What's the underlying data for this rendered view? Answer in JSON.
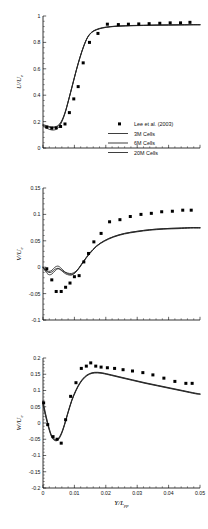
{
  "figure": {
    "panel_count": 3,
    "background": "#ffffff",
    "marker_color": "#000000",
    "line_colors": {
      "3M": "#1c1c1c",
      "6M": "#3a3a3a",
      "20M": "#8c8c8c"
    }
  },
  "legend": {
    "position": "inside-lower-right-of-top-panel",
    "entries": [
      {
        "label": "Lee et al. (2003)",
        "style": "marker",
        "marker": "filled-square"
      },
      {
        "label": "3M Cells",
        "style": "line"
      },
      {
        "label": "6M Cells",
        "style": "line"
      },
      {
        "label": "20M Cells",
        "style": "line"
      }
    ]
  },
  "chart_data": [
    {
      "type": "line",
      "id": "u-velocity",
      "title": "",
      "xlabel": "",
      "ylabel": "U/U_e",
      "ylabel_main": "U/U",
      "ylabel_sub": "e",
      "xlim": [
        0,
        0.05
      ],
      "ylim": [
        0,
        1
      ],
      "xticks": [
        0,
        0.01,
        0.02,
        0.03,
        0.04,
        0.05
      ],
      "xticklabels": [
        "",
        "",
        "",
        "",
        "",
        ""
      ],
      "yticks": [
        0,
        0.2,
        0.4,
        0.6,
        0.8,
        1
      ],
      "yticklabels": [
        "0",
        "0.2",
        "0.4",
        "0.6",
        "0.8",
        "1"
      ],
      "grid": false,
      "x": [
        0.0005,
        0.0022,
        0.0037,
        0.0052,
        0.0068,
        0.0083,
        0.0098,
        0.0113,
        0.0128,
        0.0143,
        0.0162,
        0.0185,
        0.0215,
        0.0248,
        0.0282,
        0.0315,
        0.035,
        0.0385,
        0.042,
        0.0455,
        0.048
      ],
      "markers": {
        "name": "Lee et al. (2003)",
        "x": [
          0.0012,
          0.0028,
          0.0042,
          0.0056,
          0.007,
          0.0084,
          0.0098,
          0.0112,
          0.0128,
          0.0148,
          0.0175,
          0.0205,
          0.024,
          0.0272,
          0.0305,
          0.0338,
          0.0372,
          0.0405,
          0.0438,
          0.0468
        ],
        "y": [
          0.158,
          0.15,
          0.152,
          0.163,
          0.182,
          0.268,
          0.372,
          0.465,
          0.645,
          0.8,
          0.868,
          0.938,
          0.935,
          0.938,
          0.94,
          0.942,
          0.945,
          0.948,
          0.948,
          0.952
        ]
      },
      "series": [
        {
          "name": "3M Cells",
          "x": [
            0.0,
            0.001,
            0.0022,
            0.0034,
            0.0046,
            0.0058,
            0.007,
            0.0082,
            0.0094,
            0.0106,
            0.0118,
            0.013,
            0.0142,
            0.0155,
            0.017,
            0.019,
            0.0215,
            0.0245,
            0.028,
            0.032,
            0.036,
            0.04,
            0.044,
            0.048,
            0.05
          ],
          "y": [
            0.178,
            0.17,
            0.162,
            0.16,
            0.168,
            0.2,
            0.268,
            0.37,
            0.48,
            0.59,
            0.69,
            0.775,
            0.84,
            0.878,
            0.898,
            0.912,
            0.92,
            0.925,
            0.928,
            0.93,
            0.932,
            0.933,
            0.934,
            0.935,
            0.935
          ]
        },
        {
          "name": "6M Cells",
          "x": [
            0.0,
            0.001,
            0.0022,
            0.0034,
            0.0046,
            0.0058,
            0.007,
            0.0082,
            0.0094,
            0.0106,
            0.0118,
            0.013,
            0.0142,
            0.0155,
            0.017,
            0.019,
            0.0215,
            0.0245,
            0.028,
            0.032,
            0.036,
            0.04,
            0.044,
            0.048,
            0.05
          ],
          "y": [
            0.172,
            0.164,
            0.156,
            0.154,
            0.163,
            0.196,
            0.265,
            0.368,
            0.478,
            0.588,
            0.688,
            0.773,
            0.838,
            0.876,
            0.896,
            0.91,
            0.919,
            0.924,
            0.927,
            0.929,
            0.931,
            0.932,
            0.933,
            0.934,
            0.934
          ]
        },
        {
          "name": "20M Cells",
          "x": [
            0.0,
            0.001,
            0.0022,
            0.0034,
            0.0046,
            0.0058,
            0.007,
            0.0082,
            0.0094,
            0.0106,
            0.0118,
            0.013,
            0.0142,
            0.0155,
            0.017,
            0.019,
            0.0215,
            0.0245,
            0.028,
            0.032,
            0.036,
            0.04,
            0.044,
            0.048,
            0.05
          ],
          "y": [
            0.168,
            0.152,
            0.14,
            0.136,
            0.148,
            0.188,
            0.262,
            0.366,
            0.476,
            0.586,
            0.686,
            0.772,
            0.837,
            0.875,
            0.895,
            0.909,
            0.918,
            0.923,
            0.926,
            0.928,
            0.93,
            0.931,
            0.932,
            0.933,
            0.933
          ]
        }
      ]
    },
    {
      "type": "line",
      "id": "v-velocity",
      "title": "",
      "xlabel": "",
      "ylabel": "V/U_e",
      "ylabel_main": "V/U",
      "ylabel_sub": "e",
      "xlim": [
        0,
        0.05
      ],
      "ylim": [
        -0.1,
        0.15
      ],
      "xticks": [
        0,
        0.01,
        0.02,
        0.03,
        0.04,
        0.05
      ],
      "xticklabels": [
        "",
        "",
        "",
        "",
        "",
        ""
      ],
      "yticks": [
        -0.1,
        -0.05,
        0,
        0.05,
        0.1,
        0.15
      ],
      "yticklabels": [
        "-0.1",
        "-0.05",
        "0",
        "0.05",
        "0.1",
        "0.15"
      ],
      "grid": false,
      "markers": {
        "name": "Lee et al. (2003)",
        "x": [
          0.0012,
          0.0028,
          0.0042,
          0.0058,
          0.0072,
          0.0086,
          0.01,
          0.0115,
          0.013,
          0.0145,
          0.0162,
          0.0185,
          0.0212,
          0.0245,
          0.0278,
          0.0312,
          0.0345,
          0.0378,
          0.0412,
          0.0445,
          0.0472
        ],
        "y": [
          -0.003,
          -0.024,
          -0.046,
          -0.046,
          -0.038,
          -0.03,
          -0.018,
          -0.016,
          0.01,
          0.026,
          0.048,
          0.064,
          0.086,
          0.09,
          0.096,
          0.1,
          0.102,
          0.105,
          0.106,
          0.108,
          0.108
        ]
      },
      "series": [
        {
          "name": "3M Cells",
          "x": [
            0.0,
            0.0008,
            0.0018,
            0.0028,
            0.0038,
            0.0048,
            0.0058,
            0.0068,
            0.0078,
            0.009,
            0.0102,
            0.0115,
            0.013,
            0.0148,
            0.017,
            0.0195,
            0.0225,
            0.026,
            0.03,
            0.034,
            0.0385,
            0.043,
            0.047,
            0.05
          ],
          "y": [
            0.0,
            -0.006,
            -0.01,
            -0.009,
            -0.004,
            -0.002,
            -0.005,
            -0.009,
            -0.011,
            -0.012,
            -0.009,
            -0.001,
            0.012,
            0.026,
            0.04,
            0.05,
            0.058,
            0.064,
            0.068,
            0.071,
            0.073,
            0.074,
            0.075,
            0.075
          ]
        },
        {
          "name": "6M Cells",
          "x": [
            0.0,
            0.0008,
            0.0018,
            0.0028,
            0.0038,
            0.0048,
            0.0058,
            0.0068,
            0.0078,
            0.009,
            0.0102,
            0.0115,
            0.013,
            0.0148,
            0.017,
            0.0195,
            0.0225,
            0.026,
            0.03,
            0.034,
            0.0385,
            0.043,
            0.047,
            0.05
          ],
          "y": [
            0.0,
            -0.008,
            -0.014,
            -0.013,
            -0.007,
            -0.003,
            -0.006,
            -0.011,
            -0.014,
            -0.015,
            -0.011,
            -0.002,
            0.011,
            0.025,
            0.039,
            0.049,
            0.057,
            0.063,
            0.067,
            0.07,
            0.072,
            0.073,
            0.074,
            0.074
          ]
        },
        {
          "name": "20M Cells",
          "x": [
            0.0,
            0.0008,
            0.0018,
            0.0028,
            0.0038,
            0.0048,
            0.0058,
            0.0068,
            0.0078,
            0.009,
            0.0102,
            0.0115,
            0.013,
            0.0148,
            0.017,
            0.0195,
            0.0225,
            0.026,
            0.03,
            0.034,
            0.0385,
            0.043,
            0.047,
            0.05
          ],
          "y": [
            0.0,
            -0.005,
            -0.008,
            -0.006,
            0.0,
            0.002,
            -0.002,
            -0.008,
            -0.012,
            -0.014,
            -0.01,
            -0.001,
            0.012,
            0.026,
            0.04,
            0.05,
            0.058,
            0.064,
            0.068,
            0.071,
            0.073,
            0.074,
            0.075,
            0.075
          ]
        }
      ]
    },
    {
      "type": "line",
      "id": "w-velocity",
      "title": "",
      "xlabel": "Y/L_pp",
      "xlabel_main": "Y/L",
      "xlabel_sub": "pp",
      "ylabel": "W/U_e",
      "ylabel_main": "W/U",
      "ylabel_sub": "e",
      "xlim": [
        0,
        0.05
      ],
      "ylim": [
        -0.2,
        0.2
      ],
      "xticks": [
        0,
        0.01,
        0.02,
        0.03,
        0.04,
        0.05
      ],
      "xticklabels": [
        "0",
        "0.01",
        "0.02",
        "0.03",
        "0.04",
        "0.05"
      ],
      "yticks": [
        -0.2,
        -0.15,
        -0.1,
        -0.05,
        0,
        0.05,
        0.1,
        0.15,
        0.2
      ],
      "yticklabels": [
        "-0.2",
        "-0.15",
        "-0.1",
        "-0.05",
        "0",
        "0.05",
        "0.1",
        "0.15",
        "0.2"
      ],
      "grid": false,
      "markers": {
        "name": "Lee et al. (2003)",
        "x": [
          0.0002,
          0.0015,
          0.0032,
          0.0045,
          0.0058,
          0.0072,
          0.0088,
          0.0105,
          0.0122,
          0.0138,
          0.0152,
          0.0168,
          0.0185,
          0.0205,
          0.0228,
          0.0255,
          0.0285,
          0.0318,
          0.035,
          0.0385,
          0.042,
          0.0455,
          0.0475
        ],
        "y": [
          0.062,
          -0.005,
          -0.042,
          -0.05,
          -0.062,
          0.01,
          0.082,
          0.124,
          0.168,
          0.175,
          0.185,
          0.175,
          0.172,
          0.17,
          0.168,
          0.164,
          0.16,
          0.155,
          0.148,
          0.138,
          0.128,
          0.122,
          0.122
        ]
      },
      "series": [
        {
          "name": "3M Cells",
          "x": [
            0.0,
            0.0008,
            0.0018,
            0.0028,
            0.0038,
            0.0048,
            0.0058,
            0.0068,
            0.008,
            0.0092,
            0.0105,
            0.0118,
            0.0132,
            0.0148,
            0.0165,
            0.0185,
            0.021,
            0.0245,
            0.0285,
            0.0325,
            0.0365,
            0.0405,
            0.0445,
            0.0485,
            0.05
          ],
          "y": [
            0.068,
            0.03,
            -0.01,
            -0.04,
            -0.05,
            -0.048,
            -0.032,
            -0.005,
            0.035,
            0.072,
            0.102,
            0.125,
            0.142,
            0.152,
            0.156,
            0.155,
            0.15,
            0.142,
            0.133,
            0.124,
            0.116,
            0.108,
            0.1,
            0.092,
            0.09
          ]
        },
        {
          "name": "6M Cells",
          "x": [
            0.0,
            0.0008,
            0.0018,
            0.0028,
            0.0038,
            0.0048,
            0.0058,
            0.0068,
            0.008,
            0.0092,
            0.0105,
            0.0118,
            0.0132,
            0.0148,
            0.0165,
            0.0185,
            0.021,
            0.0245,
            0.0285,
            0.0325,
            0.0365,
            0.0405,
            0.0445,
            0.0485,
            0.05
          ],
          "y": [
            0.062,
            0.026,
            -0.013,
            -0.042,
            -0.052,
            -0.05,
            -0.034,
            -0.007,
            0.033,
            0.07,
            0.1,
            0.123,
            0.14,
            0.151,
            0.155,
            0.154,
            0.149,
            0.141,
            0.132,
            0.123,
            0.115,
            0.107,
            0.099,
            0.091,
            0.089
          ]
        },
        {
          "name": "20M Cells",
          "x": [
            0.0,
            0.0008,
            0.0018,
            0.0028,
            0.0038,
            0.0048,
            0.0058,
            0.0068,
            0.008,
            0.0092,
            0.0105,
            0.0118,
            0.0132,
            0.0148,
            0.0165,
            0.0185,
            0.021,
            0.0245,
            0.0285,
            0.0325,
            0.0365,
            0.0405,
            0.0445,
            0.0485,
            0.05
          ],
          "y": [
            0.055,
            0.022,
            -0.016,
            -0.044,
            -0.054,
            -0.052,
            -0.036,
            -0.008,
            0.032,
            0.069,
            0.099,
            0.122,
            0.139,
            0.15,
            0.154,
            0.153,
            0.148,
            0.14,
            0.131,
            0.122,
            0.114,
            0.106,
            0.098,
            0.09,
            0.088
          ]
        }
      ]
    }
  ]
}
